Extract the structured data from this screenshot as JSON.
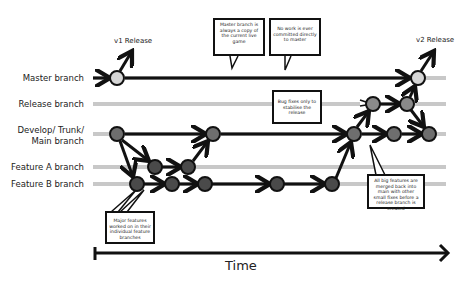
{
  "branches": {
    "master": "Master branch",
    "release": "Release branch",
    "develop_l1": "Develop/ Trunk/",
    "develop_l2": "Main branch",
    "feature_a": "Feature A branch",
    "feature_b": "Feature B branch"
  },
  "releases": {
    "v1": "v1 Release",
    "v2": "v2 Release"
  },
  "callouts": {
    "master_copy": "Master branch is always a copy of the current live game",
    "no_direct": "No work is ever committed directly to master",
    "bug_fixes": "Bug fixes only to stabilise the release",
    "major_features": "Major features worked on in their individual feature branches",
    "merged_back": "All big features are merged back into main with other small fixes before a release branch is created"
  },
  "axis": {
    "label": "Time"
  },
  "colors": {
    "master_node": "#d6d6d6",
    "release_node": "#8a8a8a",
    "develop_node": "#6e6e6e",
    "feature_node": "#4a4a4a",
    "lane": "#c8c8c8",
    "line": "#111111"
  }
}
